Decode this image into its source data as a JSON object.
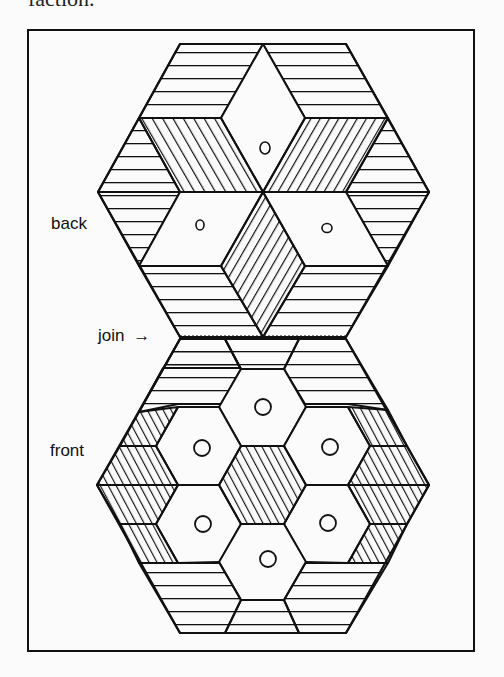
{
  "caption": "faction.",
  "figure": {
    "labels": {
      "back": "back",
      "join": "join",
      "join_arrow": "→",
      "front": "front"
    },
    "colors": {
      "ink": "#111111",
      "paper": "#fbfbfb"
    }
  }
}
